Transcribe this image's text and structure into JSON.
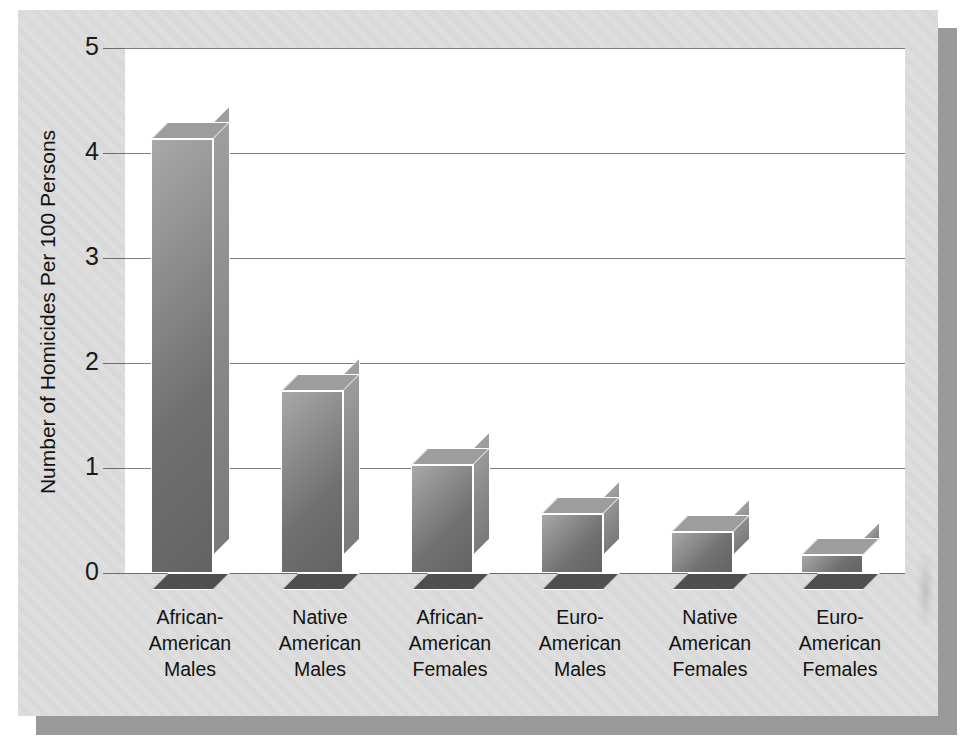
{
  "chart_data": {
    "type": "bar",
    "title": "",
    "subtitle": "",
    "xlabel": "",
    "ylabel": "Number of Homicides Per 100 Persons",
    "ylim": [
      0,
      5
    ],
    "yticks": [
      "5",
      "4",
      "3",
      "2",
      "1",
      "0"
    ],
    "ytick_values": [
      5,
      4,
      3,
      2,
      1,
      0
    ],
    "grid": true,
    "legend": "none",
    "style": "3d-bar",
    "categories": [
      "African-\nAmerican\nMales",
      "Native\nAmerican\nMales",
      "African-\nAmerican\nFemales",
      "Euro-\nAmerican\nMales",
      "Native\nAmerican\nFemales",
      "Euro-\nAmerican\nFemales"
    ],
    "category_lines": [
      [
        "African-",
        "American",
        "Males"
      ],
      [
        "Native",
        "American",
        "Males"
      ],
      [
        "African-",
        "American",
        "Females"
      ],
      [
        "Euro-",
        "American",
        "Males"
      ],
      [
        "Native",
        "American",
        "Females"
      ],
      [
        "Euro-",
        "American",
        "Females"
      ]
    ],
    "values": [
      4.13,
      1.73,
      1.03,
      0.56,
      0.39,
      0.17
    ]
  },
  "colors": {
    "card_background": "#d5d5d5",
    "plot_background": "#ffffff",
    "gridline": "#7d7d7d",
    "bar_front_light": "#a8a8a8",
    "bar_front_dark": "#636363",
    "bar_side": "#8a8a8a",
    "bar_bottom": "#4f4f4f",
    "bar_outline": "#ffffff",
    "text": "#111111",
    "shadow": "#9a9a9a"
  }
}
